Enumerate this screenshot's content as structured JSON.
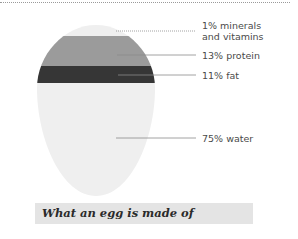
{
  "diagram": {
    "title": "What an egg is made of",
    "segments": [
      {
        "label": "1% minerals and vitamins",
        "line1": "1% minerals",
        "line2": "and vitamins",
        "percent": 1,
        "color": "#efefef"
      },
      {
        "label": "13% protein",
        "percent": 13,
        "color": "#9b9b9b"
      },
      {
        "label": "11% fat",
        "percent": 11,
        "color": "#363636"
      },
      {
        "label": "75% water",
        "percent": 75,
        "color": "#efefef"
      }
    ]
  }
}
